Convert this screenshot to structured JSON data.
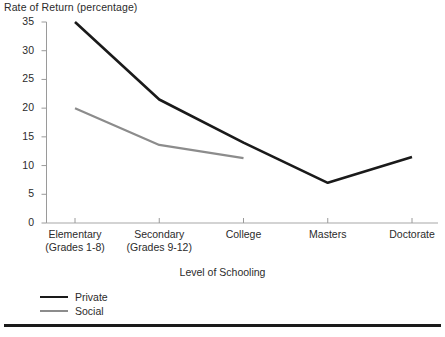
{
  "chart_data": {
    "type": "line",
    "title": "Rate of Return (percentage)",
    "xlabel": "Level of Schooling",
    "ylabel": "Rate of Return (percentage)",
    "categories": [
      "Elementary\n(Grades 1-8)",
      "Secondary\n(Grades 9-12)",
      "College",
      "Masters",
      "Doctorate"
    ],
    "category_lines": [
      [
        "Elementary",
        "(Grades 1-8)"
      ],
      [
        "Secondary",
        "(Grades 9-12)"
      ],
      [
        "College",
        ""
      ],
      [
        "Masters",
        ""
      ],
      [
        "Doctorate",
        ""
      ]
    ],
    "series": [
      {
        "name": "Private",
        "color": "#1a1a1a",
        "values": [
          35,
          21.5,
          14,
          7,
          11.5
        ]
      },
      {
        "name": "Social",
        "color": "#8c8c8c",
        "values": [
          20,
          13.6,
          11.3,
          null,
          null
        ]
      }
    ],
    "ylim": [
      0,
      35
    ],
    "yticks": [
      0,
      5,
      10,
      15,
      20,
      25,
      30,
      35
    ],
    "ytick_labels": [
      "0",
      "5",
      "10",
      "15",
      "20",
      "25",
      "30",
      "35"
    ],
    "grid": false,
    "legend_position": "bottom-left"
  },
  "legend": {
    "entries": [
      {
        "label": "Private"
      },
      {
        "label": "Social"
      }
    ]
  },
  "axes": {
    "y_title": "Rate of Return (percentage)",
    "x_title": "Level of Schooling"
  }
}
